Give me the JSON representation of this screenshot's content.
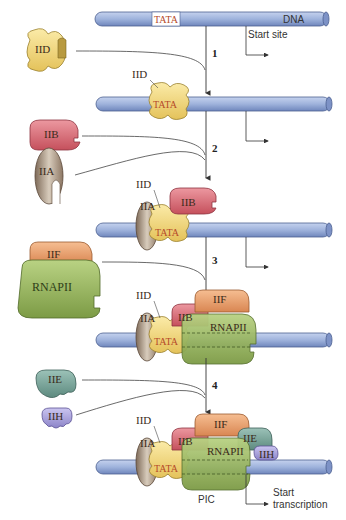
{
  "diagram": {
    "dna_label": "DNA",
    "promoter_label": "TATA",
    "start_site_label": "Start site",
    "steps": [
      "1",
      "2",
      "3",
      "4"
    ],
    "factors": {
      "iid": "IID",
      "iib": "IIB",
      "iia": "IIA",
      "iif": "IIF",
      "rnapii": "RNAPII",
      "iie": "IIE",
      "iih": "IIH"
    },
    "complex_label": "PIC",
    "start_transcription_label_1": "Start",
    "start_transcription_label_2": "transcription",
    "colors": {
      "dna": "#9fb3dc",
      "dna_dark": "#5d74a8",
      "iid": "#f1d77a",
      "iib": "#d9707a",
      "iia": "#a58f7a",
      "iif": "#e9a070",
      "rnapii": "#98b560",
      "iie": "#78a59a",
      "iih": "#a7a0d8"
    }
  }
}
